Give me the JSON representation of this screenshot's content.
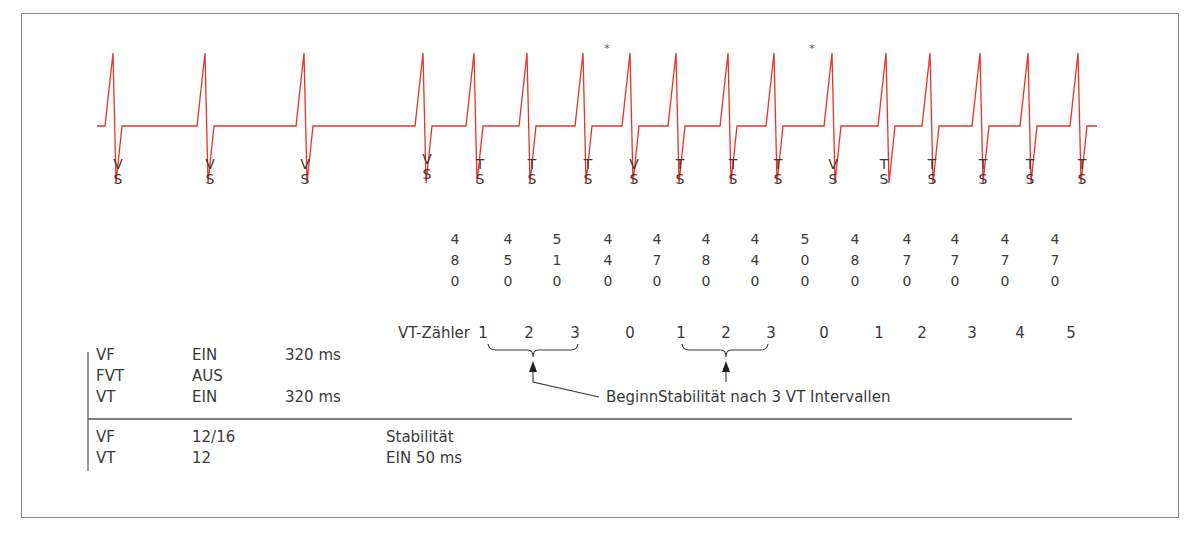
{
  "diagram": {
    "ecg_color": "#e8332a",
    "beats": [
      {
        "peak_x": 113,
        "label": [
          "V",
          "S"
        ],
        "label_x": 118,
        "label_y": 157
      },
      {
        "peak_x": 205,
        "label": [
          "V",
          "S"
        ],
        "label_x": 210,
        "label_y": 157
      },
      {
        "peak_x": 304,
        "label": [
          "V",
          "S"
        ],
        "label_x": 305,
        "label_y": 157
      },
      {
        "peak_x": 423,
        "label": [
          "V",
          "S"
        ],
        "label_x": 427,
        "label_y": 152
      },
      {
        "peak_x": 474,
        "label": [
          "T",
          "S"
        ],
        "label_x": 480,
        "label_y": 157
      },
      {
        "peak_x": 527,
        "label": [
          "T",
          "S"
        ],
        "label_x": 532,
        "label_y": 157
      },
      {
        "peak_x": 583,
        "label": [
          "T",
          "S"
        ],
        "label_x": 588,
        "label_y": 157
      },
      {
        "peak_x": 630,
        "label": [
          "V",
          "S"
        ],
        "label_x": 634,
        "label_y": 157
      },
      {
        "peak_x": 676,
        "label": [
          "T",
          "S"
        ],
        "label_x": 680,
        "label_y": 157
      },
      {
        "peak_x": 728,
        "label": [
          "T",
          "S"
        ],
        "label_x": 733,
        "label_y": 157
      },
      {
        "peak_x": 774,
        "label": [
          "T",
          "S"
        ],
        "label_x": 778,
        "label_y": 157
      },
      {
        "peak_x": 832,
        "label": [
          "V",
          "S"
        ],
        "label_x": 833,
        "label_y": 157
      },
      {
        "peak_x": 886,
        "label": [
          "T",
          "S"
        ],
        "label_x": 884,
        "label_y": 157
      },
      {
        "peak_x": 930,
        "label": [
          "T",
          "S"
        ],
        "label_x": 932,
        "label_y": 157
      },
      {
        "peak_x": 980,
        "label": [
          "T",
          "S"
        ],
        "label_x": 983,
        "label_y": 157
      },
      {
        "peak_x": 1028,
        "label": [
          "T",
          "S"
        ],
        "label_x": 1030,
        "label_y": 157
      },
      {
        "peak_x": 1078,
        "label": [
          "T",
          "S"
        ],
        "label_x": 1082,
        "label_y": 157
      }
    ],
    "asterisks": [
      {
        "x": 607,
        "y": 42,
        "text": "*"
      },
      {
        "x": 812,
        "y": 42,
        "text": "*"
      }
    ],
    "intervals_ms": [
      {
        "x": 455,
        "value": "480"
      },
      {
        "x": 508,
        "value": "450"
      },
      {
        "x": 557,
        "value": "510"
      },
      {
        "x": 608,
        "value": "440"
      },
      {
        "x": 657,
        "value": "470"
      },
      {
        "x": 706,
        "value": "480"
      },
      {
        "x": 755,
        "value": "440"
      },
      {
        "x": 805,
        "value": "500"
      },
      {
        "x": 855,
        "value": "480"
      },
      {
        "x": 907,
        "value": "470"
      },
      {
        "x": 955,
        "value": "470"
      },
      {
        "x": 1005,
        "value": "470"
      },
      {
        "x": 1055,
        "value": "470"
      }
    ],
    "vt_counter": {
      "label": "VT-Zähler",
      "values": [
        {
          "x": 483,
          "v": "1"
        },
        {
          "x": 529,
          "v": "2"
        },
        {
          "x": 575,
          "v": "3"
        },
        {
          "x": 630,
          "v": "0"
        },
        {
          "x": 681,
          "v": "1"
        },
        {
          "x": 726,
          "v": "2"
        },
        {
          "x": 771,
          "v": "3"
        },
        {
          "x": 824,
          "v": "0"
        },
        {
          "x": 879,
          "v": "1"
        },
        {
          "x": 922,
          "v": "2"
        },
        {
          "x": 972,
          "v": "3"
        },
        {
          "x": 1020,
          "v": "4"
        },
        {
          "x": 1071,
          "v": "5"
        }
      ]
    },
    "annotations": {
      "beginn": "Beginn",
      "stability_note": "Stabilität nach 3 VT Intervallen"
    },
    "settings_table": {
      "rows": [
        {
          "zone": "VF",
          "state": "EIN",
          "interval": "320 ms"
        },
        {
          "zone": "FVT",
          "state": "AUS",
          "interval": ""
        },
        {
          "zone": "VT",
          "state": "EIN",
          "interval": "320 ms"
        }
      ],
      "detection_rows": [
        {
          "zone": "VF",
          "count": "12/16",
          "note": "Stabilität"
        },
        {
          "zone": "VT",
          "count": "12",
          "note": "EIN 50 ms"
        }
      ]
    }
  }
}
